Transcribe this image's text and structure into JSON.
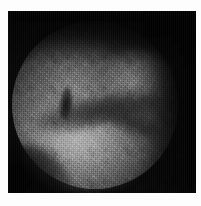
{
  "viewer": {
    "kind": "still-image",
    "modality_label": "Endoscopic grayscale still frame",
    "alt_text": "Grayscale endoscopic image: circular illuminated field of view showing granular mucosal tissue with a dark diagonal fold across the center",
    "background_color": "#fdfdfd"
  },
  "image": {
    "name": "endoscopy-frame",
    "color_mode": "grayscale",
    "frame": {
      "x": 8,
      "y": 11,
      "width": 188,
      "height": 182,
      "background_color": "#040404",
      "border_color": "#ffffff"
    },
    "field_of_view": {
      "shape": "circle",
      "center_x_pct": 47,
      "center_y_pct": 56,
      "diameter_px": 167,
      "vignette": "radial dark falloff to black at the square corners"
    },
    "regions": [
      {
        "name": "lower-left-bright-mucosa",
        "brightness": "brightest",
        "gray_level": "#c4c4c4"
      },
      {
        "name": "upper-right-bright-lobe",
        "brightness": "moderate",
        "gray_level": "#aaaaaa"
      },
      {
        "name": "upper-left-ridge",
        "brightness": "moderate-low",
        "gray_level": "#969696"
      },
      {
        "name": "central-dark-fold",
        "brightness": "dark",
        "gray_level": "#1a1a1a"
      },
      {
        "name": "central-dark-notch",
        "brightness": "darkest-interior",
        "gray_level": "#0c0c0c"
      },
      {
        "name": "superior-unlit-band",
        "brightness": "near-black",
        "gray_level": "#050505"
      },
      {
        "name": "right-unlit-band",
        "brightness": "near-black",
        "gray_level": "#040404"
      },
      {
        "name": "bottom-left-corner-shade",
        "brightness": "near-black",
        "gray_level": "#030303"
      }
    ],
    "texture": {
      "name": "granular-speckle-noise",
      "description": "high-frequency mottled pixel noise across the illuminated field with faint vertical scanline striping"
    }
  }
}
